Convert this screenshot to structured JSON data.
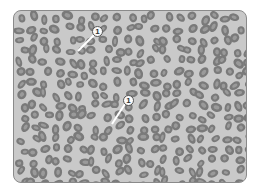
{
  "image": {
    "description": "Grayscale blood smear micrograph showing numerous oval red blood cells",
    "colors": {
      "background": "#c9c9c9",
      "cell_fill": "#7a7a7a",
      "cell_center": "#9a9a9a",
      "border": "#8a8a8a"
    }
  },
  "callouts": [
    {
      "label": "1",
      "x": 97,
      "y": 31,
      "line_to": [
        78,
        51
      ]
    },
    {
      "label": "1",
      "x": 128,
      "y": 100,
      "line_to": [
        112,
        124
      ]
    }
  ]
}
